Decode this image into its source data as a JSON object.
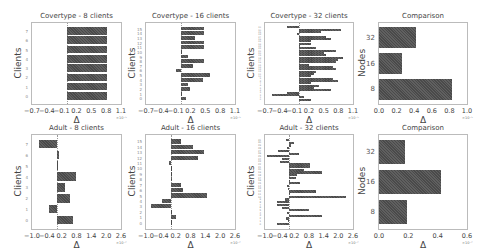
{
  "chart_data": [
    {
      "type": "bar",
      "orientation": "horizontal",
      "title": "Covertype - 8 clients",
      "xlabel": "Δ",
      "ylabel": "Clients",
      "x_exponent": "×10⁻⁵",
      "xticks": [
        "−0.7",
        "−0.4",
        "−0.1",
        "0.2",
        "0.5",
        "0.8",
        "1.1"
      ],
      "xlim": [
        -0.7,
        1.1
      ],
      "categories": [
        "0",
        "1",
        "2",
        "3",
        "4",
        "5",
        "6",
        "7"
      ],
      "values": [
        0.82,
        0.82,
        0.82,
        0.82,
        0.82,
        0.82,
        0.82,
        0.82
      ]
    },
    {
      "type": "bar",
      "orientation": "horizontal",
      "title": "Covertype - 16 clients",
      "xlabel": "Δ",
      "ylabel": "Clients",
      "x_exponent": "×10⁻⁵",
      "xticks": [
        "−0.7",
        "−0.4",
        "−0.1",
        "0.2",
        "0.5",
        "0.8",
        "1.1"
      ],
      "xlim": [
        -0.7,
        1.1
      ],
      "categories": [
        "0",
        "1",
        "2",
        "3",
        "4",
        "5",
        "6",
        "7",
        "8",
        "9",
        "10",
        "11",
        "12",
        "13",
        "14",
        "15"
      ],
      "values": [
        0.1,
        0.0,
        0.2,
        0.15,
        0.45,
        0.6,
        -0.1,
        0.25,
        0.48,
        0.15,
        0.0,
        0.48,
        0.48,
        0.3,
        0.48,
        0.48
      ]
    },
    {
      "type": "bar",
      "orientation": "horizontal",
      "title": "Covertype - 32 clients",
      "xlabel": "Δ",
      "ylabel": "Clients",
      "x_exponent": "×10⁻⁵",
      "xticks": [
        "−0.7",
        "−0.4",
        "−0.1",
        "0.2",
        "0.5",
        "0.8",
        "1.1"
      ],
      "xlim": [
        -0.7,
        1.1
      ],
      "categories": [
        "0",
        "1",
        "2",
        "3",
        "4",
        "5",
        "6",
        "7",
        "8",
        "9",
        "10",
        "11",
        "12",
        "13",
        "14",
        "15",
        "16",
        "17",
        "18",
        "19",
        "20",
        "21",
        "22",
        "23",
        "24",
        "25",
        "26",
        "27",
        "28",
        "29",
        "30",
        "31"
      ],
      "values": [
        0.25,
        0.1,
        -0.55,
        -0.25,
        0.65,
        0.3,
        0.4,
        0.25,
        0.8,
        0.7,
        0.25,
        0.3,
        0.35,
        0.75,
        0.7,
        0.2,
        0.75,
        0.8,
        0.9,
        0.55,
        0.5,
        0.75,
        0.35,
        0.0,
        0.25,
        0.25,
        0.65,
        0.55,
        -0.05,
        0.45,
        0.85,
        -0.25
      ]
    },
    {
      "type": "bar",
      "orientation": "horizontal",
      "title": "Comparison",
      "xlabel": "Δ",
      "ylabel": "Nodes",
      "x_exponent": "×10⁻⁵",
      "xticks": [
        "0.0",
        "0.2",
        "0.4",
        "0.6",
        "0.8",
        "1.0"
      ],
      "xlim": [
        0,
        1.0
      ],
      "categories": [
        "8",
        "16",
        "32"
      ],
      "values": [
        0.83,
        0.26,
        0.42
      ]
    },
    {
      "type": "bar",
      "orientation": "horizontal",
      "title": "Adult - 8 clients",
      "xlabel": "Δ",
      "ylabel": "Clients",
      "x_exponent": "×10⁻²",
      "xticks": [
        "−1.0",
        "−0.4",
        "0.2",
        "0.8",
        "1.4",
        "2.0",
        "2.6"
      ],
      "xlim": [
        -1.0,
        2.6
      ],
      "categories": [
        "0",
        "1",
        "2",
        "3",
        "4",
        "5",
        "6",
        "7"
      ],
      "values": [
        0.65,
        -0.3,
        0.55,
        0.35,
        0.8,
        0.0,
        0.1,
        -0.7
      ]
    },
    {
      "type": "bar",
      "orientation": "horizontal",
      "title": "Adult - 16 clients",
      "xlabel": "Δ",
      "ylabel": "Clients",
      "x_exponent": "×10⁻²",
      "xticks": [
        "−1.0",
        "−0.4",
        "0.2",
        "0.8",
        "1.4",
        "2.0",
        "2.6"
      ],
      "xlim": [
        -1.0,
        2.6
      ],
      "categories": [
        "0",
        "1",
        "2",
        "3",
        "4",
        "5",
        "6",
        "7",
        "8",
        "9",
        "10",
        "11",
        "12",
        "13",
        "14",
        "15"
      ],
      "values": [
        0.0,
        0.2,
        0.02,
        -0.8,
        -0.35,
        1.45,
        0.5,
        0.4,
        0.05,
        0.02,
        0.0,
        -0.05,
        1.1,
        1.35,
        0.9,
        0.4
      ]
    },
    {
      "type": "bar",
      "orientation": "horizontal",
      "title": "Adult - 32 clients",
      "xlabel": "Δ",
      "ylabel": "Clients",
      "x_exponent": "×10⁻²",
      "xticks": [
        "−1.0",
        "−0.4",
        "0.2",
        "0.8",
        "1.4",
        "2.0",
        "2.6"
      ],
      "xlim": [
        -1.0,
        2.6
      ],
      "categories": [
        "0",
        "1",
        "2",
        "3",
        "4",
        "5",
        "6",
        "7",
        "8",
        "9",
        "10",
        "11",
        "12",
        "13",
        "14",
        "15",
        "16",
        "17",
        "18",
        "19",
        "20",
        "21",
        "22",
        "23",
        "24",
        "25",
        "26",
        "27",
        "28",
        "29",
        "30",
        "31"
      ],
      "values": [
        -0.5,
        -0.05,
        -0.15,
        1.35,
        -0.1,
        0.8,
        -0.3,
        -0.5,
        -0.5,
        -0.2,
        2.3,
        0.0,
        1.1,
        -0.05,
        -0.1,
        0.45,
        0.0,
        0.25,
        0.3,
        1.35,
        0.6,
        0.85,
        0.85,
        -0.4,
        -0.3,
        -0.9,
        0.4,
        -0.45,
        -0.1,
        0.05,
        0.2,
        -0.15
      ]
    },
    {
      "type": "bar",
      "orientation": "horizontal",
      "title": "Comparison",
      "xlabel": "Δ",
      "ylabel": "Nodes",
      "x_exponent": "×10⁻²",
      "xticks": [
        "0.0",
        "0.2",
        "0.4",
        "0.6"
      ],
      "xlim": [
        0,
        0.6
      ],
      "categories": [
        "8",
        "16",
        "32"
      ],
      "values": [
        0.19,
        0.42,
        0.18
      ]
    }
  ],
  "layout": {
    "panels": [
      {
        "x": 31,
        "y": 22,
        "w": 91,
        "h": 83
      },
      {
        "x": 145,
        "y": 22,
        "w": 91,
        "h": 83
      },
      {
        "x": 264,
        "y": 22,
        "w": 90,
        "h": 83
      },
      {
        "x": 378,
        "y": 22,
        "w": 90,
        "h": 83
      },
      {
        "x": 31,
        "y": 134,
        "w": 91,
        "h": 96
      },
      {
        "x": 145,
        "y": 134,
        "w": 91,
        "h": 96
      },
      {
        "x": 264,
        "y": 134,
        "w": 90,
        "h": 96
      },
      {
        "x": 378,
        "y": 134,
        "w": 90,
        "h": 96
      }
    ]
  }
}
